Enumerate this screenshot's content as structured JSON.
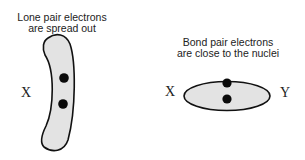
{
  "left_panel": {
    "caption_line1": "Lone pair electrons",
    "caption_line2": "are spread out",
    "atom_label": "X"
  },
  "right_panel": {
    "caption_line1": "Bond pair electrons",
    "caption_line2": "are close to the nuclei",
    "atom_left_label": "X",
    "atom_right_label": "Y"
  },
  "colors": {
    "orbital_fill": "#e3e3e3",
    "outline": "#111111",
    "electron": "#0a0a0a"
  }
}
